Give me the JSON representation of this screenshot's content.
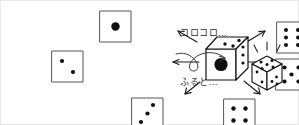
{
  "figure": {
    "background_color": "#ffffff",
    "ink_color": "#1a1a1a",
    "border_color": "#e9e9e9"
  },
  "center_die": {
    "name": "central-3d-die",
    "front_face_value": 1,
    "top_face_value": 3,
    "right_face_value": 3,
    "description": "3D cube drawn in oblique projection with one large pip on the front face"
  },
  "face_cards": [
    {
      "id": "face-1",
      "value": 1,
      "position": "top-left",
      "pips": 1,
      "x": 99,
      "y": 10,
      "size": 31
    },
    {
      "id": "face-2",
      "value": 2,
      "position": "left",
      "pips": 2,
      "x": 51,
      "y": 50,
      "size": 31
    },
    {
      "id": "face-3",
      "value": 3,
      "position": "bottom-left",
      "pips": 3,
      "x": 131,
      "y": 97,
      "size": 31
    },
    {
      "id": "face-4",
      "value": 4,
      "position": "bottom-center",
      "pips": 4,
      "x": 223,
      "y": 98,
      "size": 31
    },
    {
      "id": "face-5",
      "value": 5,
      "position": "right",
      "pips": 5,
      "x": 275,
      "y": 58,
      "size": 31
    },
    {
      "id": "face-6",
      "value": 6,
      "position": "top-right",
      "pips": 6,
      "x": 276,
      "y": 21,
      "size": 31
    }
  ],
  "arrows": [
    {
      "id": "arrow-to-1",
      "from": "center-die",
      "to": "face-1",
      "direction": "up-left"
    },
    {
      "id": "arrow-to-2",
      "from": "center-die",
      "to": "face-2",
      "direction": "left"
    },
    {
      "id": "arrow-to-3",
      "from": "center-die",
      "to": "face-3",
      "direction": "down-left"
    },
    {
      "id": "arrow-to-4",
      "from": "center-die",
      "to": "face-4",
      "direction": "down-right"
    },
    {
      "id": "arrow-to-5",
      "from": "center-die",
      "to": "face-5",
      "direction": "right"
    },
    {
      "id": "arrow-to-6",
      "from": "center-die",
      "to": "face-6",
      "direction": "up-right"
    }
  ],
  "annotations": {
    "rolling_sound": "コロコロ…",
    "shake_caption": "ふると…"
  },
  "roll_arrow": {
    "name": "looping-roll-arrow",
    "description": "curved arrow with a loop pointing from the shake caption toward the result die"
  },
  "result_die": {
    "name": "result-3d-die",
    "top_face_value": 5,
    "left_face_value": 2,
    "right_face_value": 3,
    "has_impact_lines": true,
    "impact_line_count": 3
  }
}
